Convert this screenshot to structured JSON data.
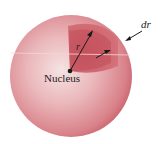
{
  "diagram": {
    "labels": {
      "nucleus": "Nucleus",
      "radius": "r",
      "shell_thickness": "dr"
    },
    "colors": {
      "sphere": "#d97a80",
      "sphere_highlight": "#f4dcdc",
      "wedge": "#c5555e",
      "arrow": "#1a1a1a",
      "background": "#ffffff"
    }
  }
}
